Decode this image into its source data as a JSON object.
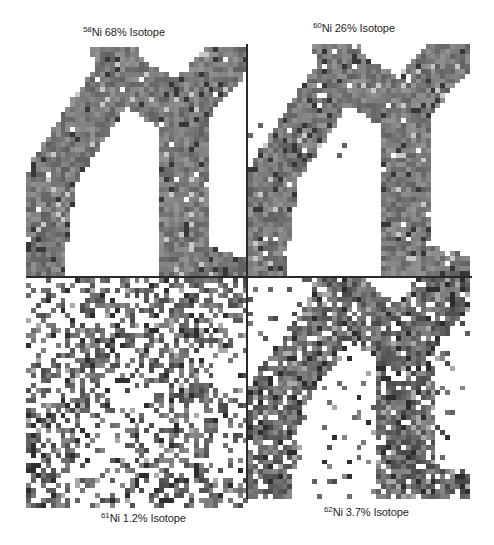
{
  "figure": {
    "background": "#ffffff",
    "line_color": "#2a2a2a",
    "panels": [
      {
        "id": "ni58",
        "mass_number": "58",
        "label_text": "Ni 68% Isotope",
        "element": "Ni",
        "abundance": "68%",
        "label_position": "top",
        "x": 26,
        "y": 47,
        "w": 222,
        "h": 230,
        "density_in": 0.98,
        "density_out": 0.0,
        "tone": "mid"
      },
      {
        "id": "ni60",
        "mass_number": "60",
        "label_text": "Ni 26% Isotope",
        "element": "Ni",
        "abundance": "26%",
        "label_position": "top",
        "x": 248,
        "y": 44,
        "w": 222,
        "h": 232,
        "density_in": 0.97,
        "density_out": 0.003,
        "tone": "mid"
      },
      {
        "id": "ni61",
        "mass_number": "61",
        "label_text": "Ni 1.2% Isotope",
        "element": "Ni",
        "abundance": "1.2%",
        "label_position": "bottom",
        "x": 26,
        "y": 278,
        "w": 222,
        "h": 230,
        "density_in": 0.55,
        "density_out": 0.3,
        "tone": "dark"
      },
      {
        "id": "ni62",
        "mass_number": "62",
        "label_text": "Ni 3.7% Isotope",
        "element": "Ni",
        "abundance": "3.7%",
        "label_position": "bottom",
        "x": 248,
        "y": 277,
        "w": 222,
        "h": 222,
        "density_in": 0.88,
        "density_out": 0.1,
        "tone": "dark"
      }
    ],
    "labels": [
      {
        "mass": "58",
        "text": "Ni 68% Isotope",
        "x": 83,
        "y": 27
      },
      {
        "mass": "60",
        "text": "Ni 26% Isotope",
        "x": 313,
        "y": 23
      },
      {
        "mass": "61",
        "text": "Ni 1.2% Isotope",
        "x": 101,
        "y": 513
      },
      {
        "mass": "62",
        "text": "Ni 3.7% Isotope",
        "x": 324,
        "y": 507
      }
    ]
  }
}
